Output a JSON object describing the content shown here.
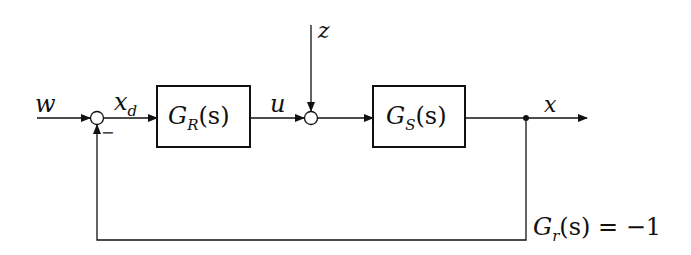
{
  "diagram": {
    "type": "block-diagram",
    "title": "",
    "signals": {
      "input": "w",
      "error": "x",
      "error_sub": "d",
      "control": "u",
      "disturbance": "z",
      "output": "x"
    },
    "blocks": [
      {
        "id": "controller",
        "name": "G",
        "sub": "R",
        "arg": "(s)"
      },
      {
        "id": "plant",
        "name": "G",
        "sub": "S",
        "arg": "(s)"
      }
    ],
    "feedback": {
      "name": "G",
      "sub": "r",
      "arg": "(s)",
      "equals": " = −1",
      "sign": "−"
    },
    "colors": {
      "line": "#111111",
      "background": "#ffffff"
    }
  }
}
